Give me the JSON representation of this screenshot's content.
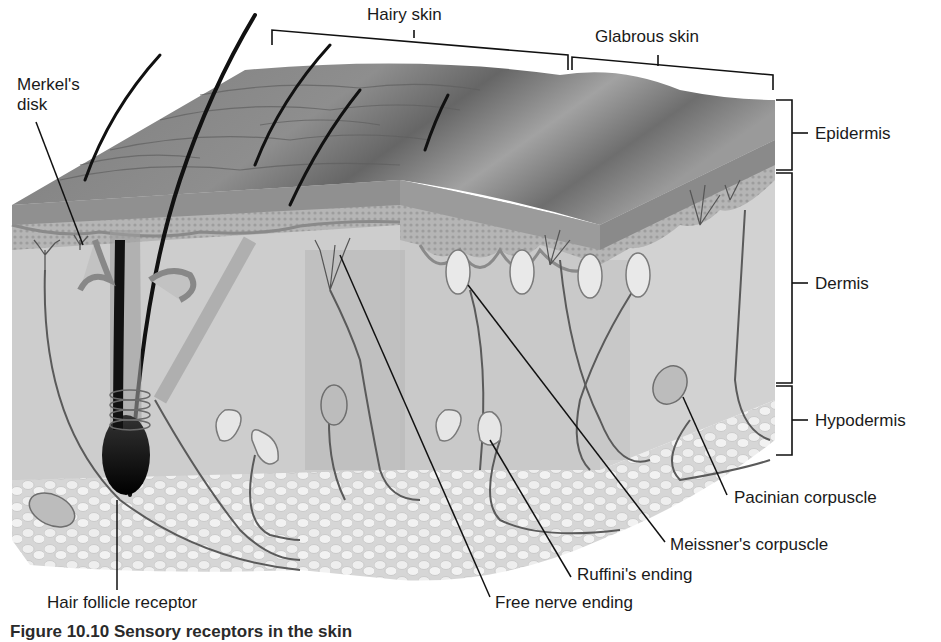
{
  "figure": {
    "caption": "Figure 10.10 Sensory receptors in the skin",
    "colors": {
      "background": "#ffffff",
      "epidermis_surface": "#8c8c8c",
      "epidermis_layer": "#9a9a9a",
      "dermis": "#cfcfcf",
      "dermis_dark_band": "#b8b8b8",
      "hypodermis_fat": "#e8e8e8",
      "hair": "#111111",
      "nerve": "#5a5a5a",
      "leader_line": "#111111",
      "text": "#1a1a1a"
    }
  },
  "regions": {
    "top": [
      {
        "label": "Hairy skin"
      },
      {
        "label": "Glabrous skin"
      }
    ],
    "layers": [
      {
        "label": "Epidermis"
      },
      {
        "label": "Dermis"
      },
      {
        "label": "Hypodermis"
      }
    ]
  },
  "receptors": [
    {
      "label": "Merkel's disk"
    },
    {
      "label": "Hair follicle receptor"
    },
    {
      "label": "Free nerve ending"
    },
    {
      "label": "Ruffini's ending"
    },
    {
      "label": "Meissner's corpuscle"
    },
    {
      "label": "Pacinian corpuscle"
    }
  ]
}
